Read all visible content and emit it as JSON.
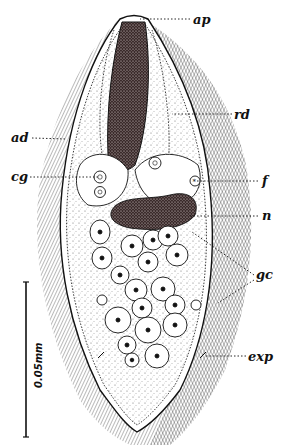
{
  "figure": {
    "type": "biological-line-drawing",
    "labels": [
      {
        "id": "ap",
        "text": "ap",
        "x": 193,
        "y": 13,
        "pointer_to": [
          120,
          19
        ]
      },
      {
        "id": "rd",
        "text": "rd",
        "x": 234,
        "y": 108,
        "pointer_to": [
          175,
          113
        ]
      },
      {
        "id": "ad",
        "text": "ad",
        "x": 11,
        "y": 131,
        "pointer_to": [
          65,
          139
        ]
      },
      {
        "id": "cg",
        "text": "cg",
        "x": 11,
        "y": 170,
        "pointer_to": [
          100,
          177
        ]
      },
      {
        "id": "f",
        "text": "f",
        "x": 262,
        "y": 174,
        "pointer_to": [
          195,
          181
        ]
      },
      {
        "id": "n",
        "text": "n",
        "x": 262,
        "y": 209,
        "pointer_to": [
          190,
          216
        ]
      },
      {
        "id": "gc",
        "text": "gc",
        "x": 256,
        "y": 268,
        "pointer_to": [
          [
            190,
            232
          ],
          [
            218,
            303
          ]
        ]
      },
      {
        "id": "exp",
        "text": "exp",
        "x": 248,
        "y": 350,
        "pointer_to": [
          205,
          356
        ]
      }
    ],
    "scale_bar": {
      "label": "0.05mm",
      "x": 26,
      "y_top": 282,
      "y_bottom": 437
    },
    "colors": {
      "ink": "#111111",
      "paper": "#ffffff",
      "stipple": "#555555"
    }
  }
}
